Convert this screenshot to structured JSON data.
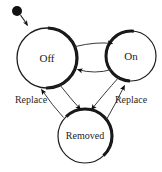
{
  "diagram": {
    "type": "uml-state-machine",
    "background_color": "#ffffff",
    "stroke_color": "#141414",
    "text_color": "#1c1c1c",
    "initial_state": {
      "name": "initial-pseudostate",
      "shape": "filled-circle",
      "cx": 17,
      "cy": 11,
      "r": 5,
      "fill": "#111111"
    },
    "states": [
      {
        "id": "off",
        "label": "Off",
        "cx": 47,
        "cy": 58,
        "r": 30,
        "font_size": 11
      },
      {
        "id": "on",
        "label": "On",
        "cx": 131,
        "cy": 56,
        "r": 25,
        "font_size": 11
      },
      {
        "id": "removed",
        "label": "Removed",
        "cx": 85,
        "cy": 136,
        "r": 27,
        "font_size": 10
      }
    ],
    "transitions": [
      {
        "id": "start-to-off",
        "from": "initial-pseudostate",
        "to": "off",
        "label": ""
      },
      {
        "id": "off-to-on",
        "from": "off",
        "to": "on",
        "label": ""
      },
      {
        "id": "on-to-off",
        "from": "on",
        "to": "off",
        "label": ""
      },
      {
        "id": "off-to-removed",
        "from": "off",
        "to": "removed",
        "label": ""
      },
      {
        "id": "on-to-removed",
        "from": "on",
        "to": "removed",
        "label": ""
      },
      {
        "id": "removed-to-off",
        "from": "removed",
        "to": "off",
        "label": "Replace",
        "label_x": 31,
        "label_y": 101,
        "font_size": 10
      },
      {
        "id": "removed-to-on",
        "from": "removed",
        "to": "on",
        "label": "Replace",
        "label_x": 131,
        "label_y": 101,
        "font_size": 10
      }
    ]
  }
}
